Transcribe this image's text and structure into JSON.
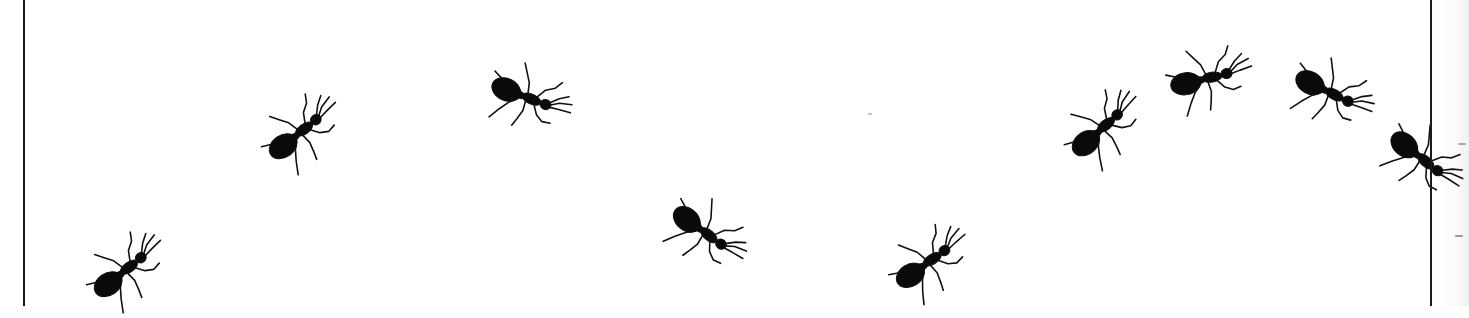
{
  "image": {
    "description": "Black silhouette ants walking across a white panel bounded by vertical lines",
    "background_color": "#ffffff",
    "ink_color": "#0a0a0a",
    "border_color": "#1a1a1a",
    "border_lines_x": [
      24,
      1431
    ]
  },
  "ants": [
    {
      "id": 1,
      "cx": 125,
      "cy": 270,
      "rotation": -35,
      "scale": 1.0
    },
    {
      "id": 2,
      "cx": 300,
      "cy": 132,
      "rotation": -35,
      "scale": 1.0
    },
    {
      "id": 3,
      "cx": 527,
      "cy": 97,
      "rotation": 25,
      "scale": 1.0
    },
    {
      "id": 4,
      "cx": 705,
      "cy": 232,
      "rotation": 40,
      "scale": 1.0
    },
    {
      "id": 5,
      "cx": 928,
      "cy": 262,
      "rotation": -32,
      "scale": 1.0
    },
    {
      "id": 6,
      "cx": 1102,
      "cy": 128,
      "rotation": -38,
      "scale": 1.0
    },
    {
      "id": 7,
      "cx": 1207,
      "cy": 78,
      "rotation": -10,
      "scale": 1.0
    },
    {
      "id": 8,
      "cx": 1330,
      "cy": 92,
      "rotation": 30,
      "scale": 1.0
    },
    {
      "id": 9,
      "cx": 1422,
      "cy": 158,
      "rotation": 42,
      "scale": 1.0
    }
  ]
}
